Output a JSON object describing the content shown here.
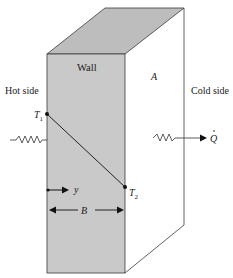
{
  "diagram": {
    "type": "heat-conduction-through-wall",
    "labels": {
      "wall": "Wall",
      "area": "A",
      "hot_side": "Hot side",
      "cold_side": "Cold side",
      "t1": "T",
      "t1_sub": "1",
      "t2": "T",
      "t2_sub": "2",
      "y": "y",
      "thickness": "B",
      "heat_flow": "Q"
    },
    "colors": {
      "wall_fill": "#c9c9c9",
      "top_fill": "#bdbdbd",
      "line": "#3a3a3a",
      "background": "#ffffff"
    },
    "geometry": {
      "front_face": {
        "x1": 47,
        "y1": 54,
        "x2": 125,
        "y2": 273
      },
      "back_top": {
        "x1": 105,
        "x2": 184,
        "y": 8
      },
      "back_right_bottom_y": 225,
      "t1_point": [
        47,
        114
      ],
      "t2_point": [
        125,
        187
      ]
    }
  }
}
